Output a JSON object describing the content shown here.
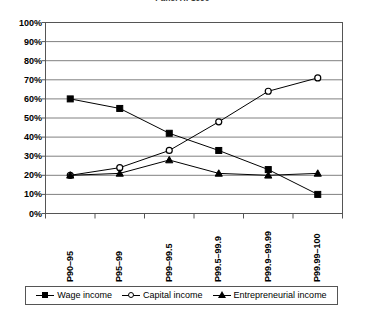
{
  "chart_data": {
    "type": "line",
    "title": "Panel A: 1990",
    "categories": [
      "P90–95",
      "P95–99",
      "P99–99.5",
      "P99.5–99.9",
      "P99.9–99.99",
      "P99.99–100"
    ],
    "series": [
      {
        "name": "Wage income",
        "marker": "filled-square",
        "values": [
          60,
          55,
          42,
          33,
          23,
          10
        ]
      },
      {
        "name": "Capital income",
        "marker": "open-circle",
        "values": [
          20,
          24,
          33,
          48,
          64,
          71
        ]
      },
      {
        "name": "Entrepreneurial income",
        "marker": "filled-triangle",
        "values": [
          20,
          21,
          28,
          21,
          20,
          21
        ]
      }
    ],
    "xlabel": "",
    "ylabel": "",
    "ylim": [
      0,
      100
    ],
    "ytick_labels": [
      "100%",
      "90%",
      "80%",
      "70%",
      "60%",
      "50%",
      "40%",
      "30%",
      "20%",
      "10%",
      "0%"
    ],
    "ytick_values": [
      100,
      90,
      80,
      70,
      60,
      50,
      40,
      30,
      20,
      10,
      0
    ],
    "grid": true,
    "legend_position": "bottom",
    "line_color": "#000000",
    "grid_color": "#808080",
    "axis_color": "#555555",
    "background": "#ffffff"
  },
  "legend": {
    "items": [
      {
        "label": "Wage income",
        "marker": "filled-square"
      },
      {
        "label": "Capital income",
        "marker": "open-circle"
      },
      {
        "label": "Entrepreneurial income",
        "marker": "filled-triangle"
      }
    ]
  }
}
